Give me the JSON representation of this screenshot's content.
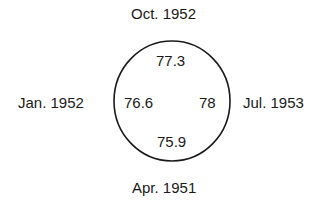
{
  "diagram": {
    "type": "circular-quadrant",
    "labels": {
      "top": "Oct. 1952",
      "left": "Jan. 1952",
      "right": "Jul. 1953",
      "bottom": "Apr. 1951"
    },
    "values": {
      "top": "77.3",
      "left": "76.6",
      "right": "78",
      "bottom": "75.9"
    },
    "circle": {
      "cx": 172,
      "cy": 101,
      "rx": 58,
      "ry": 60,
      "stroke": "#1a1a1a"
    }
  }
}
